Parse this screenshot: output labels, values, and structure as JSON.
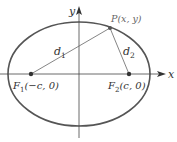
{
  "diagram": {
    "colors": {
      "ellipse": "#555555",
      "axes": "#444444",
      "segments": "#666666",
      "points": "#333333",
      "text": "#333333"
    },
    "axes": {
      "x_label": "x",
      "y_label": "y"
    },
    "point_p": {
      "label": "P(x, y)"
    },
    "segments": {
      "d1": {
        "name": "d",
        "sub": "1"
      },
      "d2": {
        "name": "d",
        "sub": "2"
      }
    },
    "foci": {
      "f1": {
        "name": "F",
        "sub": "1",
        "coords": "(−c, 0)"
      },
      "f2": {
        "name": "F",
        "sub": "2",
        "coords": "(c, 0)"
      }
    }
  }
}
